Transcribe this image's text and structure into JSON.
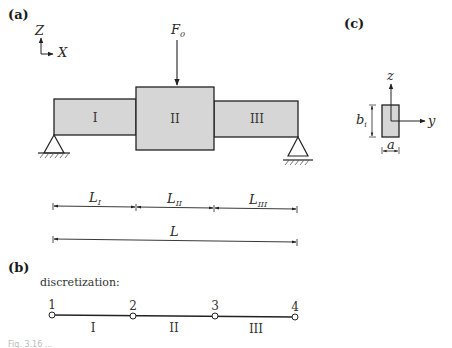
{
  "panels": {
    "a": {
      "label": "(a)",
      "axes": {
        "vertical": "Z",
        "horizontal": "X"
      },
      "force": {
        "symbol": "F",
        "subscript": "0"
      },
      "segments": [
        {
          "id": "I",
          "label": "I"
        },
        {
          "id": "II",
          "label": "II"
        },
        {
          "id": "III",
          "label": "III"
        }
      ],
      "dimensions": {
        "parts": [
          {
            "symbol": "L",
            "subscript": "I"
          },
          {
            "symbol": "L",
            "subscript": "II"
          },
          {
            "symbol": "L",
            "subscript": "III"
          }
        ],
        "total": {
          "symbol": "L"
        }
      }
    },
    "b": {
      "label": "(b)",
      "title": "discretization:",
      "nodes": [
        "1",
        "2",
        "3",
        "4"
      ],
      "elements": [
        "I",
        "II",
        "III"
      ]
    },
    "c": {
      "label": "(c)",
      "axes": {
        "vertical": "z",
        "horizontal": "y"
      },
      "height_dim": {
        "symbol": "b",
        "subscript": "i"
      },
      "width_dim": {
        "symbol": "a"
      }
    }
  },
  "colors": {
    "beam_fill": "#d6d6d6",
    "stroke": "#222222"
  },
  "caption": "Fig. 3.16 ..."
}
